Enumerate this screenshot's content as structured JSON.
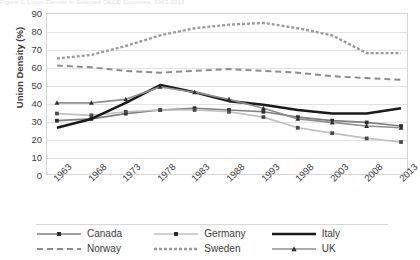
{
  "title_sliver": "Figure 1. Union Density in Selected OECD Countries, 1963-2013",
  "axes": {
    "y_title": "Union Density (%)",
    "y_ticks": [
      "90",
      "80",
      "70",
      "60",
      "50",
      "40",
      "30",
      "20",
      "10",
      "0"
    ],
    "x_ticks": [
      "1963",
      "1968",
      "1973",
      "1978",
      "1983",
      "1988",
      "1993",
      "1998",
      "2003",
      "2008",
      "2013"
    ]
  },
  "legend": {
    "items": [
      {
        "label": "Canada",
        "style": "solid-marker-square",
        "color": "#7f7f7f"
      },
      {
        "label": "Germany",
        "style": "solid-marker-square-light",
        "color": "#bfbfbf"
      },
      {
        "label": "Italy",
        "style": "solid-thick",
        "color": "#1a1a1a"
      },
      {
        "label": "Norway",
        "style": "dashed",
        "color": "#8c8c8c"
      },
      {
        "label": "Sweden",
        "style": "dotted-dense",
        "color": "#9a9a9a"
      },
      {
        "label": "UK",
        "style": "solid-marker-triangle",
        "color": "#8f8f8f"
      }
    ]
  },
  "chart_data": {
    "type": "line",
    "title": "Union Density in Selected OECD Countries, 1963-2013",
    "xlabel": "",
    "ylabel": "Union Density (%)",
    "ylim": [
      0,
      90
    ],
    "ytick_step": 10,
    "grid": true,
    "legend_position": "bottom",
    "x": [
      1963,
      1968,
      1973,
      1978,
      1983,
      1988,
      1993,
      1998,
      2003,
      2008,
      2013
    ],
    "series": [
      {
        "name": "Canada",
        "color": "#7f7f7f",
        "style": "solid",
        "marker": "square",
        "values": [
          30,
          31,
          34,
          36,
          37,
          36,
          35,
          32,
          30,
          29,
          27
        ]
      },
      {
        "name": "Germany",
        "color": "#bfbfbf",
        "style": "solid",
        "marker": "square",
        "values": [
          34,
          33,
          35,
          36,
          36,
          35,
          32,
          26,
          23,
          20,
          18
        ]
      },
      {
        "name": "Italy",
        "color": "#1a1a1a",
        "style": "solid-thick",
        "marker": "none",
        "values": [
          26,
          31,
          40,
          50,
          46,
          41,
          39,
          36,
          34,
          34,
          37
        ]
      },
      {
        "name": "Norway",
        "color": "#8c8c8c",
        "style": "dashed",
        "marker": "none",
        "values": [
          61,
          60,
          58,
          57,
          58,
          59,
          58,
          57,
          55,
          54,
          53
        ]
      },
      {
        "name": "Sweden",
        "color": "#9a9a9a",
        "style": "dotted",
        "marker": "none",
        "values": [
          65,
          67,
          72,
          78,
          82,
          84,
          85,
          82,
          78,
          68,
          68
        ]
      },
      {
        "name": "UK",
        "color": "#8f8f8f",
        "style": "solid",
        "marker": "triangle",
        "values": [
          40,
          40,
          42,
          49,
          46,
          42,
          37,
          31,
          29,
          27,
          26
        ]
      }
    ]
  }
}
